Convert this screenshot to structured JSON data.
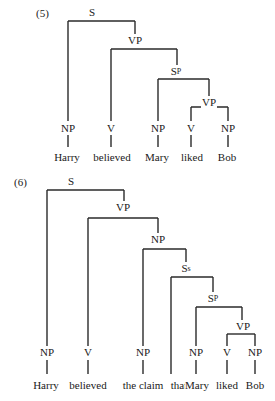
{
  "examples": [
    {
      "number": "(5)",
      "number_pos": [
        36,
        7
      ],
      "nodes": [
        {
          "id": "S",
          "label": "S",
          "sub": "",
          "x": 92,
          "y": 6
        },
        {
          "id": "VP1",
          "label": "VP",
          "sub": "",
          "x": 135,
          "y": 34
        },
        {
          "id": "Sp",
          "label": "S",
          "sub": "P",
          "x": 176,
          "y": 65
        },
        {
          "id": "VP2",
          "label": "VP",
          "sub": "",
          "x": 209,
          "y": 96
        },
        {
          "id": "NP1",
          "label": "NP",
          "sub": "",
          "x": 68,
          "y": 122
        },
        {
          "id": "V1",
          "label": "V",
          "sub": "",
          "x": 111,
          "y": 122
        },
        {
          "id": "NP2",
          "label": "NP",
          "sub": "",
          "x": 158,
          "y": 122
        },
        {
          "id": "V2",
          "label": "V",
          "sub": "",
          "x": 191,
          "y": 122
        },
        {
          "id": "NP3",
          "label": "NP",
          "sub": "",
          "x": 228,
          "y": 122
        }
      ],
      "words": [
        {
          "text": "Harry",
          "x": 67,
          "y": 151
        },
        {
          "text": "believed",
          "x": 112,
          "y": 151
        },
        {
          "text": "Mary",
          "x": 157,
          "y": 151
        },
        {
          "text": "liked",
          "x": 192,
          "y": 151
        },
        {
          "text": "Bob",
          "x": 227,
          "y": 151
        }
      ],
      "brackets": [
        {
          "left": 68,
          "right": 135,
          "top": 21,
          "bottom_left": 121,
          "bottom_right": 34
        },
        {
          "left": 111,
          "right": 177,
          "top": 49,
          "bottom_left": 121,
          "bottom_right": 65
        },
        {
          "left": 158,
          "right": 209,
          "top": 79,
          "bottom_left": 121,
          "bottom_right": 96
        },
        {
          "left": 191,
          "right": 228,
          "top": 107,
          "bottom_left": 121,
          "bottom_right": 121
        }
      ],
      "stems": [
        {
          "x": 68,
          "y1": 135,
          "y2": 147
        },
        {
          "x": 111,
          "y1": 135,
          "y2": 147
        },
        {
          "x": 158,
          "y1": 135,
          "y2": 147
        },
        {
          "x": 191,
          "y1": 135,
          "y2": 147
        },
        {
          "x": 228,
          "y1": 135,
          "y2": 147
        }
      ]
    },
    {
      "number": "(6)",
      "number_pos": [
        14,
        176
      ],
      "nodes": [
        {
          "id": "S",
          "label": "S",
          "sub": "",
          "x": 71,
          "y": 175
        },
        {
          "id": "VP1",
          "label": "VP",
          "sub": "",
          "x": 123,
          "y": 201
        },
        {
          "id": "NP0",
          "label": "NP",
          "sub": "",
          "x": 158,
          "y": 233
        },
        {
          "id": "Ss",
          "label": "S",
          "sub": "s",
          "x": 186,
          "y": 262
        },
        {
          "id": "Sp",
          "label": "S",
          "sub": "P",
          "x": 213,
          "y": 292
        },
        {
          "id": "VP2",
          "label": "VP",
          "sub": "",
          "x": 243,
          "y": 320
        },
        {
          "id": "NP1",
          "label": "NP",
          "sub": "",
          "x": 47,
          "y": 346
        },
        {
          "id": "V1",
          "label": "V",
          "sub": "",
          "x": 88,
          "y": 346
        },
        {
          "id": "NP2",
          "label": "NP",
          "sub": "",
          "x": 143,
          "y": 346
        },
        {
          "id": "NP3",
          "label": "NP",
          "sub": "",
          "x": 196,
          "y": 346
        },
        {
          "id": "V2",
          "label": "V",
          "sub": "",
          "x": 227,
          "y": 346
        },
        {
          "id": "NP4",
          "label": "NP",
          "sub": "",
          "x": 255,
          "y": 346
        }
      ],
      "words": [
        {
          "text": "Harry",
          "x": 46,
          "y": 379
        },
        {
          "text": "believed",
          "x": 88,
          "y": 379
        },
        {
          "text": "the claim",
          "x": 143,
          "y": 379
        },
        {
          "text": "that",
          "x": 179,
          "y": 379
        },
        {
          "text": "Mary",
          "x": 197,
          "y": 379
        },
        {
          "text": "liked",
          "x": 227,
          "y": 379
        },
        {
          "text": "Bob",
          "x": 255,
          "y": 379
        }
      ],
      "brackets": [
        {
          "left": 47,
          "right": 124,
          "top": 190,
          "bottom_left": 346,
          "bottom_right": 201
        },
        {
          "left": 88,
          "right": 158,
          "top": 218,
          "bottom_left": 346,
          "bottom_right": 233
        },
        {
          "left": 143,
          "right": 186,
          "top": 249,
          "bottom_left": 346,
          "bottom_right": 262
        },
        {
          "left": 171,
          "right": 213,
          "top": 277,
          "bottom_left": 374,
          "bottom_right": 292
        },
        {
          "left": 196,
          "right": 242,
          "top": 307,
          "bottom_left": 346,
          "bottom_right": 320
        },
        {
          "left": 227,
          "right": 255,
          "top": 334,
          "bottom_left": 346,
          "bottom_right": 346
        }
      ],
      "stems": [
        {
          "x": 47,
          "y1": 360,
          "y2": 374
        },
        {
          "x": 88,
          "y1": 360,
          "y2": 374
        },
        {
          "x": 143,
          "y1": 360,
          "y2": 374
        },
        {
          "x": 196,
          "y1": 360,
          "y2": 374
        },
        {
          "x": 227,
          "y1": 360,
          "y2": 374
        },
        {
          "x": 255,
          "y1": 360,
          "y2": 374
        }
      ]
    }
  ],
  "colors": {
    "line": "#2a2a2a",
    "text": "#1a1a1a",
    "background": "#ffffff"
  }
}
